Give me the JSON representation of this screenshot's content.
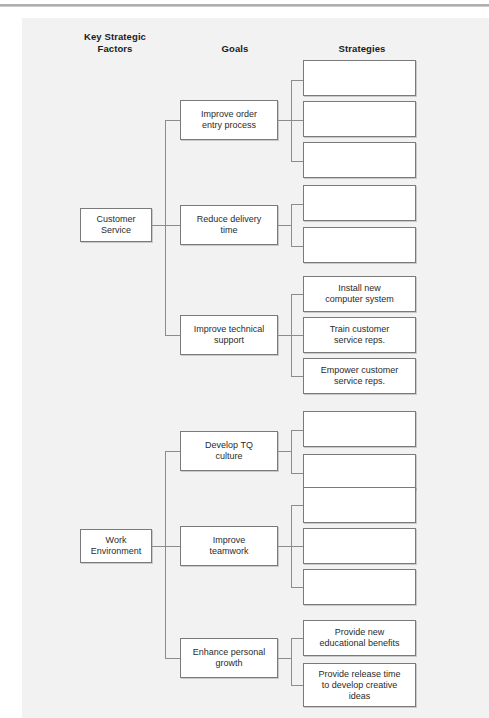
{
  "page": {
    "background_color": "#ffffff",
    "panel_color": "#f2f2f2",
    "box_border_color": "#7a7a7a",
    "connector_color": "#8c8c8c"
  },
  "headers": {
    "key_factors": "Key Strategic\nFactors",
    "key_factors_line1": "Key Strategic",
    "key_factors_line2": "Factors",
    "goals": "Goals",
    "strategies": "Strategies"
  },
  "tree": {
    "factors": [
      {
        "id": "customer-service",
        "label": "Customer\nService",
        "label_line1": "Customer",
        "label_line2": "Service",
        "goals": [
          {
            "id": "improve-order-entry",
            "label": "Improve order\nentry process",
            "label_line1": "Improve order",
            "label_line2": "entry process",
            "strategies": [
              {
                "id": "cs-g1-s1",
                "label": ""
              },
              {
                "id": "cs-g1-s2",
                "label": ""
              },
              {
                "id": "cs-g1-s3",
                "label": ""
              }
            ]
          },
          {
            "id": "reduce-delivery-time",
            "label": "Reduce delivery\ntime",
            "label_line1": "Reduce delivery",
            "label_line2": "time",
            "strategies": [
              {
                "id": "cs-g2-s1",
                "label": ""
              },
              {
                "id": "cs-g2-s2",
                "label": ""
              }
            ]
          },
          {
            "id": "improve-technical-support",
            "label": "Improve technical\nsupport",
            "label_line1": "Improve technical",
            "label_line2": "support",
            "strategies": [
              {
                "id": "cs-g3-s1",
                "label": "Install new\ncomputer system",
                "label_line1": "Install new",
                "label_line2": "computer system"
              },
              {
                "id": "cs-g3-s2",
                "label": "Train customer\nservice reps.",
                "label_line1": "Train customer",
                "label_line2": "service reps."
              },
              {
                "id": "cs-g3-s3",
                "label": "Empower customer\nservice reps.",
                "label_line1": "Empower customer",
                "label_line2": "service reps."
              }
            ]
          }
        ]
      },
      {
        "id": "work-environment",
        "label": "Work\nEnvironment",
        "label_line1": "Work",
        "label_line2": "Environment",
        "goals": [
          {
            "id": "develop-tq-culture",
            "label": "Develop TQ\nculture",
            "label_line1": "Develop TQ",
            "label_line2": "culture",
            "strategies": [
              {
                "id": "we-g1-s1",
                "label": ""
              },
              {
                "id": "we-g1-s2",
                "label": ""
              }
            ]
          },
          {
            "id": "improve-teamwork",
            "label": "Improve\nteamwork",
            "label_line1": "Improve",
            "label_line2": "teamwork",
            "strategies": [
              {
                "id": "we-g2-s1",
                "label": ""
              },
              {
                "id": "we-g2-s2",
                "label": ""
              },
              {
                "id": "we-g2-s3",
                "label": ""
              }
            ]
          },
          {
            "id": "enhance-personal-growth",
            "label": "Enhance personal\ngrowth",
            "label_line1": "Enhance personal",
            "label_line2": "growth",
            "strategies": [
              {
                "id": "we-g3-s1",
                "label": "Provide new\neducational benefits",
                "label_line1": "Provide new",
                "label_line2": "educational benefits"
              },
              {
                "id": "we-g3-s2",
                "label": "Provide release time\nto develop creative\nideas",
                "label_line1": "Provide release time",
                "label_line2": "to develop creative",
                "label_line3": "ideas"
              }
            ]
          }
        ]
      }
    ]
  }
}
